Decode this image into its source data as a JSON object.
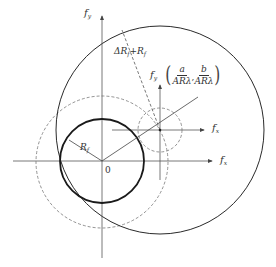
{
  "diagram": {
    "type": "geometric frequency-plane diagram",
    "colors": {
      "stroke": "#2a2a2a",
      "axis": "#555555",
      "dashed": "#777777"
    },
    "labels": {
      "fy_axis": "f",
      "fy_sub": "y",
      "fx_axis": "f",
      "fx_sub": "x",
      "fy_prime": "f",
      "fy_prime_sub": "y",
      "fx_prime": "f",
      "fx_prime_sub": "x",
      "origin": "0",
      "radius_small": "R",
      "radius_small_sub": "f",
      "radius_sum_prefix": "ΔR",
      "radius_sum_sub1": "f",
      "radius_sum_mid": "+R",
      "radius_sum_sub2": "f",
      "coord_a": "a",
      "coord_b": "b",
      "coord_den": "ARλ",
      "coord_sep": ","
    },
    "shapes": {
      "main_axes_origin": [
        102,
        161
      ],
      "small_circle": {
        "cx": 102,
        "cy": 161,
        "r": 42,
        "style": "solid-bold"
      },
      "large_dashed_circle": {
        "cx": 102,
        "cy": 162,
        "r": 66,
        "style": "dashed"
      },
      "big_circle": {
        "cx": 160,
        "cy": 130,
        "r": 104,
        "style": "solid"
      },
      "small_dashed_circle": {
        "cx": 160,
        "cy": 130,
        "r": 22,
        "style": "dashed"
      },
      "shifted_center": [
        160,
        130
      ]
    }
  }
}
